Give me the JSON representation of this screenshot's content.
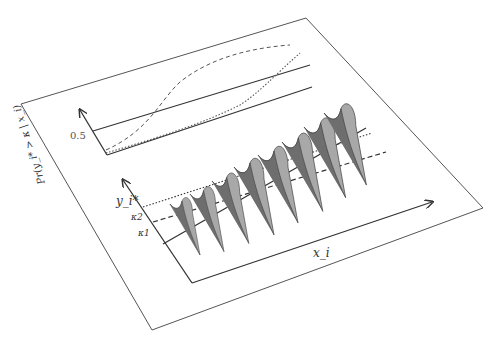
{
  "diagram": {
    "type": "ordered-probit-3d-illustration",
    "top_panel": {
      "y_axis_label": "Pr(y_i* > κ | x_i)",
      "y_tick_label": "0.5",
      "curves": [
        {
          "name": "dashed",
          "style": "dashed"
        },
        {
          "name": "dotted",
          "style": "dotted"
        },
        {
          "name": "reference-0.5",
          "style": "solid"
        }
      ]
    },
    "bottom_panel": {
      "y_axis_label": "y_i*",
      "x_axis_label": "x_i",
      "thresholds": [
        {
          "label": "κ2",
          "style": "dotted"
        },
        {
          "label": "κ1",
          "style": "dashed"
        }
      ],
      "regression_line": "solid",
      "density_count": 8
    },
    "colors": {
      "line": "#333333",
      "plane": "#555555",
      "fill_dark": "#6e6e6e",
      "fill_light": "#a8a8a8"
    }
  }
}
